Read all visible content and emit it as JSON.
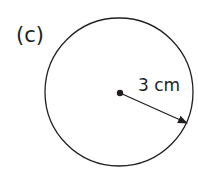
{
  "figure": {
    "part_label": "(c)",
    "shape": "circle",
    "radius_label": "3 cm",
    "colors": {
      "stroke": "#231f20",
      "background": "#ffffff"
    }
  }
}
